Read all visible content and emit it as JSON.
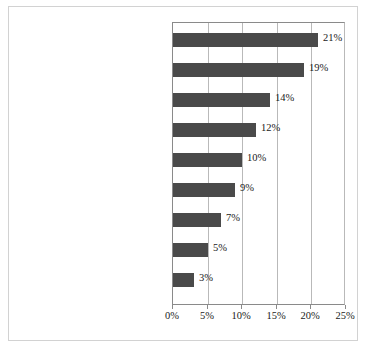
{
  "chart_data": {
    "type": "bar",
    "orientation": "horizontal",
    "title": "",
    "xlabel": "",
    "ylabel": "",
    "xlim": [
      0,
      25
    ],
    "xticks": [
      0,
      5,
      10,
      15,
      20,
      25
    ],
    "xtick_labels": [
      "0%",
      "5%",
      "10%",
      "15%",
      "20%",
      "25%"
    ],
    "grid": true,
    "legend": false,
    "bar_color": "#4a4a4a",
    "categories": [
      "Boring",
      "Too violent",
      "Don't like the genre",
      "Books better",
      "Too complex",
      "Too depressing/anxiety producing/ dark",
      "Rape scenes",
      "The sex",
      "Too bizarre/weird"
    ],
    "values": [
      21,
      19,
      14,
      12,
      10,
      9,
      7,
      5,
      3
    ],
    "value_labels": [
      "21%",
      "19%",
      "14%",
      "12%",
      "10%",
      "9%",
      "7%",
      "5%",
      "3%"
    ]
  },
  "rows": [
    {
      "label_line1": "Boring",
      "label_line2": "",
      "value": 21,
      "value_label": "21%"
    },
    {
      "label_line1": "Too violent",
      "label_line2": "",
      "value": 19,
      "value_label": "19%"
    },
    {
      "label_line1": "Don't like the genre",
      "label_line2": "",
      "value": 14,
      "value_label": "14%"
    },
    {
      "label_line1": "Books better",
      "label_line2": "",
      "value": 12,
      "value_label": "12%"
    },
    {
      "label_line1": "Too complex",
      "label_line2": "",
      "value": 10,
      "value_label": "10%"
    },
    {
      "label_line1": "Too depressing/anxiety producing/",
      "label_line2": "dark",
      "value": 9,
      "value_label": "9%"
    },
    {
      "label_line1": "Rape scenes",
      "label_line2": "",
      "value": 7,
      "value_label": "7%"
    },
    {
      "label_line1": "The sex",
      "label_line2": "",
      "value": 5,
      "value_label": "5%"
    },
    {
      "label_line1": "Too bizarre/weird",
      "label_line2": "",
      "value": 3,
      "value_label": "3%"
    }
  ],
  "axis": {
    "ticks": [
      "0%",
      "5%",
      "10%",
      "15%",
      "20%",
      "25%"
    ]
  }
}
